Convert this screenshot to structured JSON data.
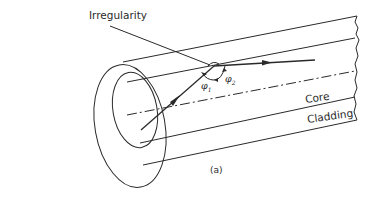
{
  "figure": {
    "labels": {
      "irregularity": "Irregularity",
      "core": "Core",
      "cladding": "Cladding",
      "phi1_symbol": "φ",
      "phi1_sub": "1",
      "phi2_symbol": "φ",
      "phi2_sub": "2",
      "caption": "(a)"
    },
    "colors": {
      "stroke": "#2a2a2a",
      "background": "#ffffff"
    },
    "elements": [
      "outer-cladding-cylinder",
      "inner-core-cylinder",
      "fiber-axis-dash-dot",
      "incident-ray-with-arrow",
      "reflected-ray-with-arrow",
      "irregularity-bump",
      "angle-arcs-phi1-phi2",
      "leader-line-to-irregularity",
      "broken-end-line"
    ]
  }
}
